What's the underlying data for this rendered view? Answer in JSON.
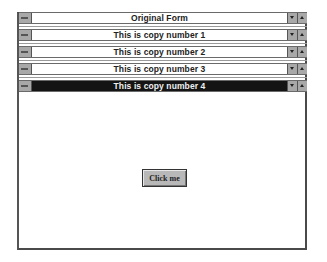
{
  "windows": [
    {
      "title": "Original Form",
      "active": false
    },
    {
      "title": "This is copy number 1",
      "active": false
    },
    {
      "title": "This is copy number 2",
      "active": false
    },
    {
      "title": "This is copy number 3",
      "active": false
    },
    {
      "title": "This is copy number 4",
      "active": true
    }
  ],
  "controls": {
    "control_menu_icon": "control-menu",
    "minimize_icon": "minimize-arrow",
    "maximize_icon": "maximize-arrow"
  },
  "form": {
    "button_label": "Click me"
  },
  "colors": {
    "active_title": "#141414",
    "inactive_title": "#ffffff",
    "button_face": "#b8b8b8"
  }
}
